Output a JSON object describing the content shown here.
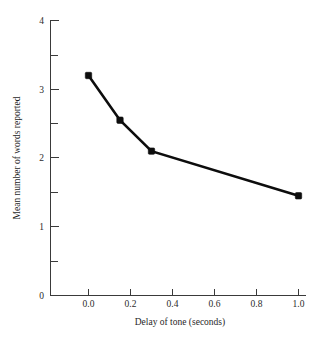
{
  "chart_data": {
    "type": "line",
    "title": "",
    "xlabel": "Delay of tone (seconds)",
    "ylabel": "Mean number of words reported",
    "x": [
      0.0,
      0.15,
      0.3,
      1.0
    ],
    "values": [
      3.2,
      2.55,
      2.1,
      1.45
    ],
    "series": [
      {
        "name": "Mean number of words reported",
        "x": [
          0.0,
          0.15,
          0.3,
          1.0
        ],
        "values": [
          3.2,
          2.55,
          2.1,
          1.45
        ]
      }
    ],
    "xlim": [
      -0.07,
      1.08
    ],
    "ylim": [
      0,
      4
    ],
    "xticks": [
      0.0,
      0.2,
      0.4,
      0.6,
      0.8,
      1.0
    ],
    "xtick_labels": [
      "0.0",
      "0.2",
      "0.4",
      "0.6",
      "0.8",
      "1.0"
    ],
    "yticks": [
      0,
      1,
      2,
      3,
      4
    ],
    "ytick_labels": [
      "0",
      "1",
      "2",
      "3",
      "4"
    ],
    "y_minor_ticks": [
      0.5,
      1.5,
      2.5,
      3.5
    ],
    "grid": false,
    "legend": false,
    "legend_position": "none",
    "line_color": "#0d0d0d",
    "marker": "filled-square",
    "marker_color": "#0d0d0d",
    "background_color": "#ffffff",
    "axis_color": "#3a3a3a"
  }
}
